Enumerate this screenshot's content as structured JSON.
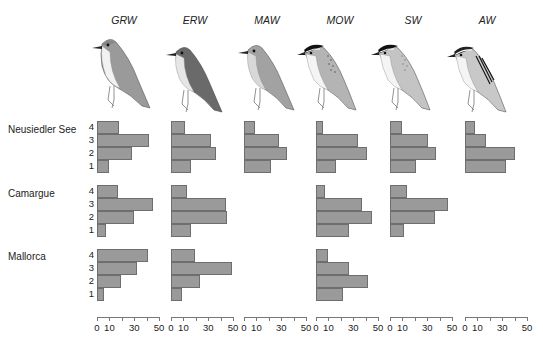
{
  "chart_data": {
    "type": "bar",
    "orientation": "horizontal",
    "title": "",
    "xlabel": "",
    "ylabel": "",
    "xlim": [
      0,
      50
    ],
    "xticks": [
      0,
      10,
      20,
      30,
      40,
      50
    ],
    "xtick_labels": [
      "0",
      "10",
      "30",
      "50"
    ],
    "categories": [
      "1",
      "2",
      "3",
      "4"
    ],
    "species": [
      "GRW",
      "ERW",
      "MAW",
      "MOW",
      "SW",
      "AW"
    ],
    "sites": [
      "Neusiedler See",
      "Camargue",
      "Mallorca"
    ],
    "panels": [
      {
        "site": "Neusiedler See",
        "species": "GRW",
        "values": {
          "1": 10,
          "2": 28,
          "3": 42,
          "4": 18
        }
      },
      {
        "site": "Neusiedler See",
        "species": "ERW",
        "values": {
          "1": 16,
          "2": 36,
          "3": 32,
          "4": 11
        }
      },
      {
        "site": "Neusiedler See",
        "species": "MAW",
        "values": {
          "1": 22,
          "2": 35,
          "3": 28,
          "4": 9
        }
      },
      {
        "site": "Neusiedler See",
        "species": "MOW",
        "values": {
          "1": 16,
          "2": 41,
          "3": 34,
          "4": 6
        }
      },
      {
        "site": "Neusiedler See",
        "species": "SW",
        "values": {
          "1": 21,
          "2": 37,
          "3": 31,
          "4": 10
        }
      },
      {
        "site": "Neusiedler See",
        "species": "AW",
        "values": {
          "1": 33,
          "2": 40,
          "3": 17,
          "4": 8
        }
      },
      {
        "site": "Camargue",
        "species": "GRW",
        "values": {
          "1": 7,
          "2": 30,
          "3": 45,
          "4": 17
        }
      },
      {
        "site": "Camargue",
        "species": "ERW",
        "values": {
          "1": 16,
          "2": 45,
          "3": 44,
          "4": 13
        }
      },
      {
        "site": "Camargue",
        "species": "MOW",
        "values": {
          "1": 27,
          "2": 45,
          "3": 37,
          "4": 7
        }
      },
      {
        "site": "Camargue",
        "species": "SW",
        "values": {
          "1": 11,
          "2": 36,
          "3": 47,
          "4": 14
        }
      },
      {
        "site": "Mallorca",
        "species": "GRW",
        "values": {
          "1": 6,
          "2": 19,
          "3": 32,
          "4": 41
        }
      },
      {
        "site": "Mallorca",
        "species": "ERW",
        "values": {
          "1": 9,
          "2": 23,
          "3": 49,
          "4": 19
        }
      },
      {
        "site": "Mallorca",
        "species": "MOW",
        "values": {
          "1": 22,
          "2": 42,
          "3": 27,
          "4": 10
        }
      }
    ],
    "bar_color": "#9a9a9a",
    "grid": false,
    "legend": null
  },
  "labels": {
    "species": [
      "GRW",
      "ERW",
      "MAW",
      "MOW",
      "SW",
      "AW"
    ],
    "sites": [
      "Neusiedler See",
      "Camargue",
      "Mallorca"
    ],
    "y_categories": [
      "4",
      "3",
      "2",
      "1"
    ],
    "x_ticks": [
      "0",
      "10",
      "30",
      "50"
    ]
  }
}
